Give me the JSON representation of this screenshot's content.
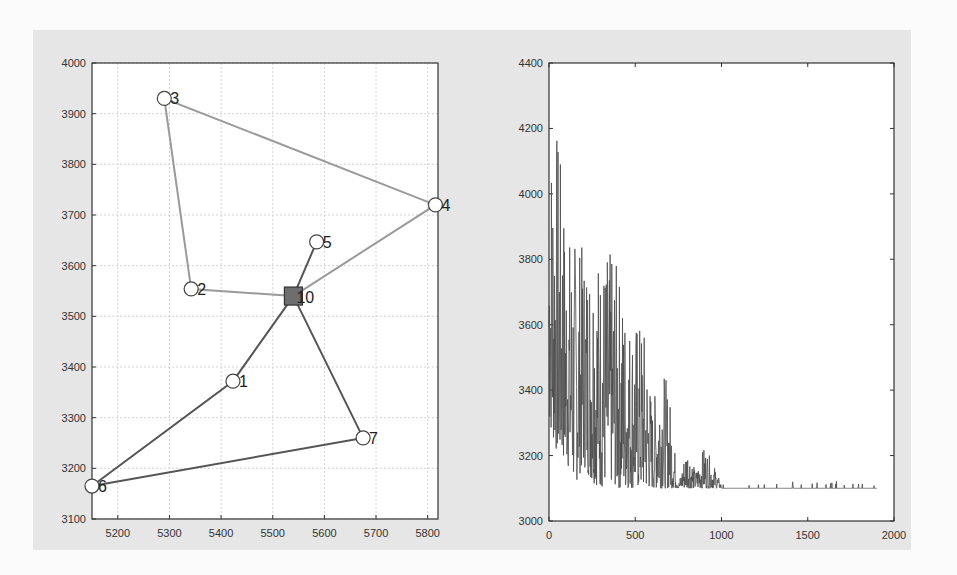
{
  "chart_data": [
    {
      "type": "scatter",
      "title": "",
      "xlabel": "",
      "ylabel": "",
      "xlim": [
        5150,
        5820
      ],
      "ylim": [
        3100,
        4000
      ],
      "grid": true,
      "xticks": [
        5200,
        5300,
        5400,
        5500,
        5600,
        5700,
        5800
      ],
      "yticks": [
        3100,
        3200,
        3300,
        3400,
        3500,
        3600,
        3700,
        3800,
        3900,
        4000
      ],
      "depot": {
        "label": "10",
        "x": 5540,
        "y": 3540,
        "marker": "square"
      },
      "nodes": [
        {
          "label": "1",
          "x": 5423,
          "y": 3372
        },
        {
          "label": "2",
          "x": 5342,
          "y": 3554
        },
        {
          "label": "3",
          "x": 5290,
          "y": 3930
        },
        {
          "label": "4",
          "x": 5815,
          "y": 3720
        },
        {
          "label": "5",
          "x": 5585,
          "y": 3647
        },
        {
          "label": "6",
          "x": 5150,
          "y": 3165
        },
        {
          "label": "7",
          "x": 5675,
          "y": 3260
        }
      ],
      "routes": [
        {
          "name": "route-light",
          "color": "#9a9a9a",
          "sequence": [
            "10",
            "2",
            "3",
            "4",
            "10"
          ]
        },
        {
          "name": "route-dark-a",
          "color": "#555555",
          "sequence": [
            "10",
            "5"
          ]
        },
        {
          "name": "route-dark-b",
          "color": "#555555",
          "sequence": [
            "10",
            "1",
            "6",
            "7",
            "10"
          ]
        }
      ]
    },
    {
      "type": "line",
      "title": "",
      "xlabel": "",
      "ylabel": "",
      "xlim": [
        0,
        2000
      ],
      "ylim": [
        3000,
        4400
      ],
      "grid": false,
      "xticks": [
        0,
        500,
        1000,
        1500,
        2000
      ],
      "yticks": [
        3000,
        3200,
        3400,
        3600,
        3800,
        4000,
        4200,
        4400
      ],
      "series": [
        {
          "name": "objective",
          "color": "#4a4a4a",
          "description": "Noisy convergence curve: oscillates heavily between ~3100 and ~4210 in early iterations, amplitude decays, flat at ~3100 after ~1000 with rare small spikes, ends at ~1900",
          "envelope_x": [
            0,
            20,
            50,
            100,
            150,
            200,
            250,
            300,
            350,
            400,
            450,
            500,
            550,
            600,
            650,
            700,
            750,
            800,
            850,
            900,
            950,
            1000,
            1100,
            1250,
            1300,
            1450,
            1680,
            1900
          ],
          "envelope_max": [
            4210,
            4210,
            4210,
            3900,
            3870,
            3840,
            3880,
            3820,
            3830,
            3780,
            3640,
            3620,
            3600,
            3350,
            3500,
            3380,
            3110,
            3240,
            3150,
            3230,
            3180,
            3110,
            3110,
            3115,
            3115,
            3115,
            3115,
            3100
          ],
          "envelope_min": [
            3300,
            3250,
            3200,
            3180,
            3110,
            3170,
            3120,
            3100,
            3120,
            3100,
            3100,
            3100,
            3100,
            3100,
            3100,
            3100,
            3100,
            3100,
            3100,
            3100,
            3100,
            3100,
            3100,
            3100,
            3100,
            3100,
            3100,
            3100
          ],
          "final_value": 3100
        }
      ]
    }
  ],
  "left_plot": {
    "xtick_labels": [
      "5200",
      "5300",
      "5400",
      "5500",
      "5600",
      "5700",
      "5800"
    ],
    "ytick_labels": [
      "3100",
      "3200",
      "3300",
      "3400",
      "3500",
      "3600",
      "3700",
      "3800",
      "3900",
      "4000"
    ]
  },
  "right_plot": {
    "xtick_labels": [
      "0",
      "500",
      "1000",
      "1500",
      "2000"
    ],
    "ytick_labels": [
      "3000",
      "3200",
      "3400",
      "3600",
      "3800",
      "4000",
      "4200",
      "4400"
    ]
  }
}
